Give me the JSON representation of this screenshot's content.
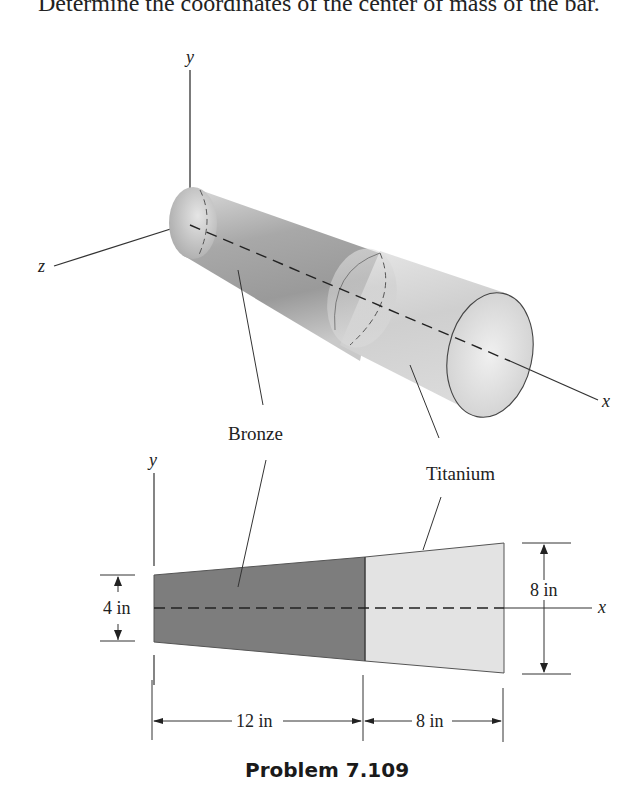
{
  "problem_statement": "Determine the coordinates of the center of mass of the bar.",
  "caption": "Problem 7.109",
  "isometric_view": {
    "axes": {
      "x": "x",
      "y": "y",
      "z": "z"
    },
    "labels": {
      "bronze": "Bronze",
      "titanium": "Titanium"
    }
  },
  "side_view": {
    "axes": {
      "x": "x",
      "y": "y"
    },
    "dimensions": {
      "left_diameter": "4 in",
      "right_diameter": "8 in",
      "bronze_length": "12 in",
      "titanium_length": "8 in"
    },
    "colors": {
      "bronze": "#7d7d7d",
      "titanium": "#e3e3e3"
    }
  }
}
